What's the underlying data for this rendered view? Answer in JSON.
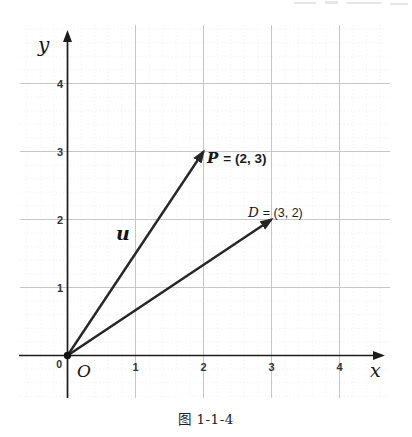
{
  "page": {
    "caption": "图 1-1-4"
  },
  "chart_data": {
    "type": "scatter",
    "title": "",
    "xlabel": "x",
    "ylabel": "y",
    "origin_label": "O",
    "origin_tick": "0",
    "x_ticks": [
      1,
      2,
      3,
      4
    ],
    "y_ticks": [
      1,
      2,
      3,
      4
    ],
    "xlim": [
      -0.7,
      4.7
    ],
    "ylim": [
      -0.65,
      4.85
    ],
    "grid": "on",
    "vectors": [
      {
        "var": "u",
        "from": [
          0,
          0
        ],
        "to": [
          2,
          3
        ],
        "point": {
          "name": "P",
          "x": 2,
          "y": 3,
          "var": "P",
          "eq": "= (2, 3)"
        }
      },
      {
        "var": "",
        "from": [
          0,
          0
        ],
        "to": [
          3,
          2
        ],
        "point": {
          "name": "D",
          "x": 3,
          "y": 2,
          "var": "D",
          "eq": "= (3, 2)"
        }
      }
    ],
    "colors": {
      "axis": "#1c1c1c",
      "grid_major": "#c6c6c6",
      "grid_minor": "#eceae6",
      "vector": "#262626",
      "text": "#333333"
    }
  }
}
